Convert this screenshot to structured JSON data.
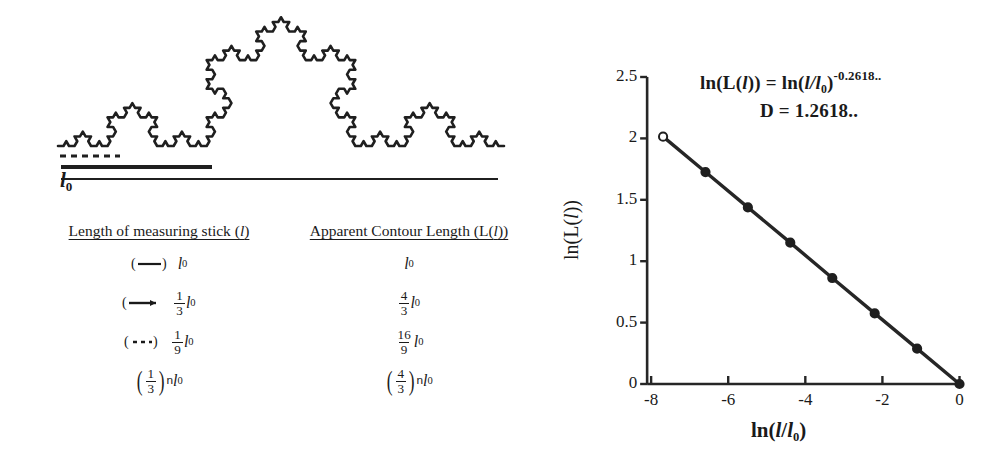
{
  "figure": {
    "caption_none": "",
    "baseline_label": "l0",
    "baseline_label_main": "l",
    "baseline_label_sub": "0"
  },
  "table": {
    "headers": [
      "Length of measuring stick (l)",
      "Apparent Contour Length (L(l))"
    ],
    "header_left_main": "Length of measuring stick (",
    "header_left_ital": "l",
    "header_left_end": ")",
    "header_right_main": "Apparent Contour Length (L(",
    "header_right_ital": "l",
    "header_right_end": "))",
    "rows": [
      {
        "marker": "solid-thin-line",
        "stick_num": "",
        "stick_den": "",
        "stick_base": "l",
        "stick_sub": "0",
        "length_num": "",
        "length_den": "",
        "length_base": "l",
        "length_sub": "0"
      },
      {
        "marker": "solid-thick-arrow",
        "stick_num": "1",
        "stick_den": "3",
        "stick_base": "l",
        "stick_sub": "0",
        "length_num": "4",
        "length_den": "3",
        "length_base": "l",
        "length_sub": "0"
      },
      {
        "marker": "dashed-line",
        "stick_num": "1",
        "stick_den": "9",
        "stick_base": "l",
        "stick_sub": "0",
        "length_num": "16",
        "length_den": "9",
        "length_base": "l",
        "length_sub": "0"
      },
      {
        "marker": "none",
        "stick_num": "1",
        "stick_den": "3",
        "stick_exp": "n",
        "stick_base": "l",
        "stick_sub": "0",
        "length_num": "4",
        "length_den": "3",
        "length_exp": "n",
        "length_base": "l",
        "length_sub": "0"
      }
    ]
  },
  "chart_data": {
    "type": "line",
    "title": "",
    "xlabel": "ln(l/l0)",
    "ylabel": "ln(L(l))",
    "xlim": [
      -8.6,
      0.35
    ],
    "ylim": [
      0,
      2.5
    ],
    "xticks": [
      -8,
      -6,
      -4,
      -2,
      0
    ],
    "xticklabels": [
      "-8",
      "-6",
      "-4",
      "-2",
      "0"
    ],
    "yticks": [
      0,
      0.5,
      1,
      1.5,
      2,
      2.5
    ],
    "yticklabels": [
      "0",
      "0.5",
      "1",
      "1.5",
      "2",
      "2.5"
    ],
    "grid": false,
    "legend": null,
    "series": [
      {
        "name": "ln(L(l)) vs ln(l/l0)",
        "marker": "circle",
        "x": [
          -7.69,
          -6.59,
          -5.49,
          -4.39,
          -3.3,
          -2.2,
          -1.1,
          0.0
        ],
        "y": [
          2.014,
          1.726,
          1.438,
          1.151,
          0.863,
          0.575,
          0.288,
          0.0
        ],
        "open_first_marker": true
      }
    ],
    "annotations": [
      {
        "id": "equation",
        "text": "ln(L(l)) = ln(l/l0)^-0.2618..",
        "parts": {
          "lead": "ln(L(",
          "l1": "l",
          "mid": ")) = ln(",
          "l2": "l/l",
          "sub": "0",
          "close": ")",
          "exp": "-0.2618.."
        }
      },
      {
        "id": "dimension",
        "text": "D = 1.2618..",
        "parts": {
          "lead": "D = 1.2618.."
        }
      }
    ]
  },
  "colors": {
    "ink": "#1a1a1a",
    "line": "#262626",
    "background": "#ffffff"
  }
}
